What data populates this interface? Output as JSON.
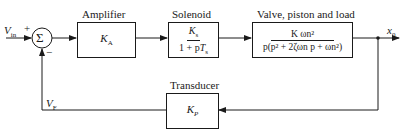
{
  "diagram": {
    "type": "block-diagram",
    "title": "",
    "input": {
      "symbol": "V",
      "subscript": "in",
      "sign": "+"
    },
    "summing_junction": {
      "symbol": "Σ",
      "feedback_sign": "−"
    },
    "blocks": [
      {
        "id": "amplifier",
        "label": "Amplifier",
        "transfer_function": {
          "text": "K",
          "subscript": "A"
        }
      },
      {
        "id": "solenoid",
        "label": "Solenoid",
        "transfer_function": {
          "numerator": "Ks",
          "numerator_symbol": "K",
          "numerator_sub": "s",
          "denominator": "1 + pTs",
          "denominator_prefix": "1 + p",
          "denominator_symbol": "T",
          "denominator_sub": "s"
        }
      },
      {
        "id": "valve",
        "label": "Valve, piston and load",
        "transfer_function": {
          "numerator": "K ωn²",
          "denominator": "p(p² + 2ζωn p + ωn²)"
        }
      },
      {
        "id": "transducer",
        "label": "Transducer",
        "transfer_function": {
          "text": "K",
          "subscript": "P"
        }
      }
    ],
    "output": {
      "symbol": "x",
      "subscript": "0"
    },
    "feedback_signal": {
      "symbol": "V",
      "subscript": "F"
    },
    "colors": {
      "line": "#1a1a1a",
      "background": "#ffffff"
    }
  }
}
